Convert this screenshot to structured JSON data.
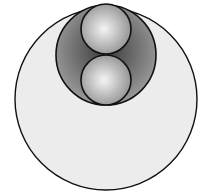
{
  "diagram": {
    "outer_circle": {
      "cx": 106,
      "cy": 99,
      "r": 91,
      "fill": "#ececec",
      "stroke": "#111111"
    },
    "middle_circle": {
      "cx": 106,
      "cy": 55,
      "r": 50,
      "fill_inner": "#3a3a3a",
      "fill_outer": "#9a9a9a",
      "stroke": "#111111"
    },
    "small_spheres": [
      {
        "cx": 106,
        "cy": 29,
        "r": 25,
        "highlight": "#f4f4f4",
        "shade": "#8a8a8a",
        "stroke": "#111111"
      },
      {
        "cx": 106,
        "cy": 80,
        "r": 25,
        "highlight": "#f4f4f4",
        "shade": "#8a8a8a",
        "stroke": "#111111"
      }
    ]
  }
}
